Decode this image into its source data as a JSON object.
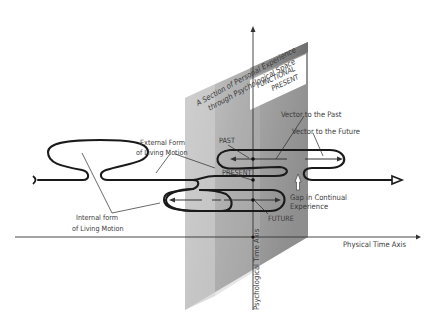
{
  "diagram": {
    "plane_title": [
      "A Section of Personal Experience",
      "through Psychological Space"
    ],
    "functional_present": [
      "FUNCTIONAL",
      "PRESENT"
    ],
    "labels": {
      "external_form": [
        "External Form",
        "of Living Motion"
      ],
      "internal_form": [
        "Internal form",
        "of Living Motion"
      ],
      "past": "PAST",
      "present": "PRESENT",
      "future": "FUTURE",
      "vector_past": "Vector to the Past",
      "vector_future": "Vector to the Future",
      "gap": [
        "Gap in Continual",
        "Experience"
      ]
    },
    "axes": {
      "physical": "Physical Time Axis",
      "psychological": "Psychological Time Axis"
    },
    "colors": {
      "plane_light": "#c9c9c9",
      "plane_mid": "#a9a9a9",
      "plane_dark": "#8c8c8c",
      "curve": "#1a1a1a",
      "text": "#3a3a3a"
    }
  }
}
